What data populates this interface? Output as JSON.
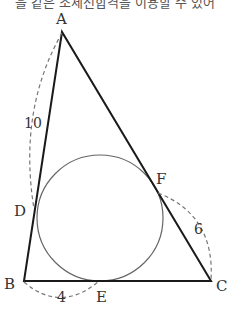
{
  "header": {
    "text": "을 같은 조세선합격을 이용할 수 있어"
  },
  "figure": {
    "vertices": [
      {
        "name": "A",
        "x": 62,
        "y": 32
      },
      {
        "name": "B",
        "x": 24,
        "y": 281
      },
      {
        "name": "C",
        "x": 211,
        "y": 281
      }
    ],
    "tangent_points": [
      {
        "name": "D",
        "x": 34,
        "y": 209
      },
      {
        "name": "E",
        "x": 98,
        "y": 281
      },
      {
        "name": "F",
        "x": 158,
        "y": 192
      }
    ],
    "incircle": {
      "cx": 100,
      "cy": 218,
      "r": 63
    },
    "labels": {
      "A": "A",
      "B": "B",
      "C": "C",
      "D": "D",
      "E": "E",
      "F": "F"
    },
    "lengths": {
      "AD": "10",
      "BE": "4",
      "FC": "6"
    },
    "colors": {
      "triangle_stroke": "#1a1a1a",
      "circle_stroke": "#666666",
      "dashed_arc": "#777777",
      "text": "#333333"
    }
  }
}
